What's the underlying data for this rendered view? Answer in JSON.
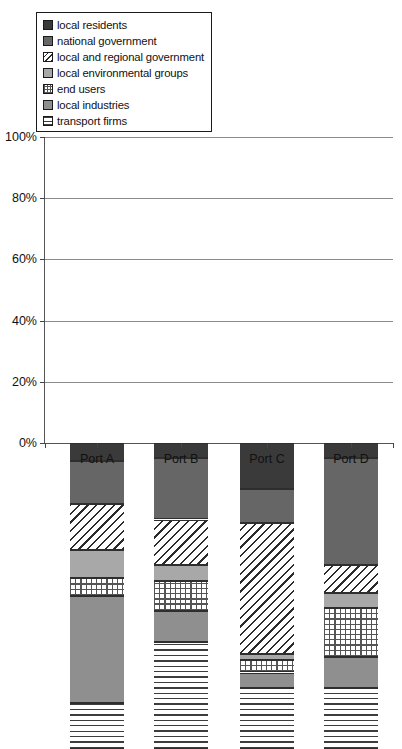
{
  "chart_data": {
    "type": "bar",
    "subtype": "stacked-percentage-column",
    "title": "",
    "xlabel": "",
    "ylabel": "",
    "categories": [
      "Port A",
      "Port B",
      "Port C",
      "Port D"
    ],
    "ylim": [
      0,
      100
    ],
    "yticks": [
      "0%",
      "20%",
      "40%",
      "60%",
      "80%",
      "100%"
    ],
    "ytick_values": [
      0,
      20,
      40,
      60,
      80,
      100
    ],
    "grid": true,
    "legend_position": "top-left",
    "stack_order_bottom_to_top": [
      "transport firms",
      "local industries",
      "end users",
      "local environmental groups",
      "local and regional government",
      "national government",
      "local residents"
    ],
    "series": [
      {
        "name": "local residents",
        "key": "residents",
        "fill": "solid-dark-gray",
        "color": "#3a3a3a",
        "values": [
          6,
          5,
          15,
          5
        ]
      },
      {
        "name": "national government",
        "key": "national",
        "fill": "solid-mid-gray",
        "color": "#666666",
        "values": [
          14,
          20,
          11,
          35
        ]
      },
      {
        "name": "local and regional government",
        "key": "localreg",
        "fill": "diagonal-hatch",
        "color": "#ffffff",
        "values": [
          15,
          15,
          43,
          9
        ]
      },
      {
        "name": "local environmental groups",
        "key": "envgroups",
        "fill": "solid-light-gray",
        "color": "#a8a8a8",
        "values": [
          9,
          5,
          2,
          5
        ]
      },
      {
        "name": "end users",
        "key": "endusers",
        "fill": "checker-dots",
        "color": "#ffffff",
        "values": [
          6,
          10,
          4,
          16
        ]
      },
      {
        "name": "local industries",
        "key": "industries",
        "fill": "solid-gray",
        "color": "#8f8f8f",
        "values": [
          35,
          10,
          5,
          10
        ]
      },
      {
        "name": "transport firms",
        "key": "transport",
        "fill": "horizontal-lines",
        "color": "#ffffff",
        "values": [
          15,
          35,
          20,
          20
        ]
      }
    ],
    "cumulative_tops_bottom_to_top": {
      "Port A": {
        "transport firms": 15,
        "local industries": 50,
        "end users": 56,
        "local environmental groups": 65,
        "local and regional government": 80,
        "national government": 94,
        "local residents": 100
      },
      "Port B": {
        "transport firms": 35,
        "local industries": 45,
        "end users": 55,
        "local environmental groups": 60,
        "local and regional government": 75,
        "national government": 95,
        "local residents": 100
      },
      "Port C": {
        "transport firms": 20,
        "local industries": 25,
        "end users": 29,
        "local environmental groups": 31,
        "local and regional government": 74,
        "national government": 85,
        "local residents": 100
      },
      "Port D": {
        "transport firms": 20,
        "local industries": 30,
        "end users": 46,
        "local environmental groups": 51,
        "local and regional government": 60,
        "national government": 95,
        "local residents": 100
      }
    }
  },
  "legend": {
    "items": [
      {
        "label": "local residents",
        "swatch": "residents"
      },
      {
        "label": "national government",
        "swatch": "national"
      },
      {
        "label": "local and regional government",
        "swatch": "localreg"
      },
      {
        "label": "local environmental groups",
        "swatch": "envgroups"
      },
      {
        "label": "end users",
        "swatch": "endusers"
      },
      {
        "label": "local industries",
        "swatch": "industries"
      },
      {
        "label": "transport firms",
        "swatch": "transport"
      }
    ]
  }
}
